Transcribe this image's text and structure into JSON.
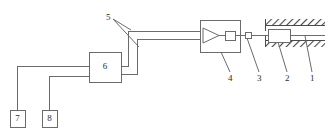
{
  "diagram": {
    "line_color": "#6b6b6b",
    "hatch_color": "#4a4a4a",
    "text_color": "#2b2b2b",
    "background": "#ffffff",
    "callouts": [
      {
        "id": "c1",
        "label": "1"
      },
      {
        "id": "c2",
        "label": "2"
      },
      {
        "id": "c3",
        "label": "3"
      },
      {
        "id": "c4",
        "label": "4"
      },
      {
        "id": "c5",
        "label": "5"
      }
    ],
    "blocks": [
      {
        "id": "b6",
        "label": "6"
      },
      {
        "id": "b7",
        "label": "7"
      },
      {
        "id": "b8",
        "label": "8"
      }
    ],
    "components": {
      "amplifier_block_label": "4",
      "sensor_label": "3",
      "mass_label": "2",
      "rod_label": "1",
      "wire_pair_label": "5",
      "controller_label": "6",
      "device7_label": "7",
      "device8_label": "8"
    }
  }
}
